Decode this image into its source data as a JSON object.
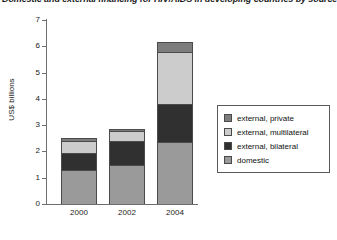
{
  "title": "Domestic and external financing for HIV/AIDS in developing countries by source",
  "chart_data": {
    "type": "bar",
    "stacked": true,
    "title": "Domestic and external financing for HIV/AIDS in developing countries by source",
    "xlabel": "",
    "ylabel": "US$ billions",
    "categories": [
      "2000",
      "2002",
      "2004"
    ],
    "ylim": [
      0,
      7
    ],
    "yticks": [
      0,
      1,
      2,
      3,
      4,
      5,
      6,
      7
    ],
    "ytick_labels": [
      "0",
      "1",
      "2",
      "3",
      "4",
      "5",
      "6",
      "7"
    ],
    "grid": false,
    "legend_position": "right",
    "series": [
      {
        "name": "domestic",
        "color": "#9a9a9a",
        "values": [
          1.3,
          1.5,
          2.35
        ]
      },
      {
        "name": "external, bilateral",
        "color": "#303030",
        "values": [
          0.65,
          0.88,
          1.45
        ]
      },
      {
        "name": "external, multilateral",
        "color": "#cccccc",
        "values": [
          0.45,
          0.38,
          2.0
        ]
      },
      {
        "name": "external, private",
        "color": "#7d7d7d",
        "values": [
          0.1,
          0.09,
          0.35
        ]
      }
    ],
    "totals": [
      2.5,
      2.85,
      6.15
    ],
    "annotations": []
  },
  "axes": {
    "y_title": "US$ billions",
    "y_ticks": [
      "7",
      "6",
      "5",
      "4",
      "3",
      "2",
      "1",
      "0"
    ],
    "x_ticks": [
      "2000",
      "2002",
      "2004"
    ]
  },
  "legend": {
    "items": [
      {
        "label": "external, private",
        "color": "#7d7d7d"
      },
      {
        "label": "external, multilateral",
        "color": "#cccccc"
      },
      {
        "label": "external, bilateral",
        "color": "#303030"
      },
      {
        "label": "domestic",
        "color": "#9a9a9a"
      }
    ]
  }
}
